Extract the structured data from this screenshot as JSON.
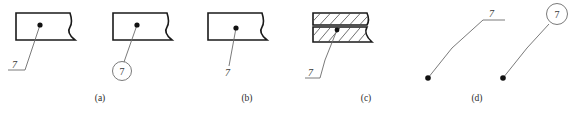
{
  "figure": {
    "width": 574,
    "height": 115,
    "background_color": "#ffffff",
    "outline_color": "#1a1a1a",
    "leader_color": "#6b6b6b",
    "hatch_color": "#4a4a4a",
    "text_color": "#3a3a3a",
    "dot_color": "#111111"
  },
  "captions": [
    {
      "label": "(a)",
      "x": 100,
      "y": 93
    },
    {
      "label": "(b)",
      "x": 247,
      "y": 93
    },
    {
      "label": "(c)",
      "x": 366,
      "y": 93
    },
    {
      "label": "(d)",
      "x": 477,
      "y": 93
    }
  ],
  "panels": [
    {
      "id": "panel-a",
      "caption": "(a)",
      "shape": "broken-rectangle",
      "annotation_value": "7",
      "annotation_style": "shelf",
      "reference_dot": {
        "x": 40,
        "y": 25
      }
    },
    {
      "id": "panel-b-left",
      "caption": "(a)",
      "shape": "broken-rectangle",
      "annotation_value": "7",
      "annotation_style": "circle",
      "reference_dot": {
        "x": 137,
        "y": 25
      }
    },
    {
      "id": "panel-b",
      "caption": "(b)",
      "shape": "broken-rectangle",
      "annotation_value": "7",
      "annotation_style": "plain",
      "reference_dot": {
        "x": 236,
        "y": 28
      }
    },
    {
      "id": "panel-c",
      "caption": "(c)",
      "shape": "hatched-section",
      "annotation_value": "7",
      "annotation_style": "shelf",
      "reference_dot": {
        "x": 337,
        "y": 30
      },
      "hatch_bands": 2
    },
    {
      "id": "panel-d-shelf",
      "caption": "(d)",
      "shape": "leader-only",
      "annotation_value": "7",
      "annotation_style": "shelf",
      "reference_dot": {
        "x": 428,
        "y": 78
      }
    },
    {
      "id": "panel-d-circle",
      "caption": "(d)",
      "shape": "leader-only",
      "annotation_value": "7",
      "annotation_style": "circle",
      "reference_dot": {
        "x": 503,
        "y": 78
      }
    }
  ],
  "annotations": {
    "value": "7",
    "a_shelf_label": "7",
    "a_circle_label": "7",
    "b_plain_label": "7",
    "c_shelf_label": "7",
    "d_shelf_label": "7",
    "d_circle_label": "7"
  }
}
